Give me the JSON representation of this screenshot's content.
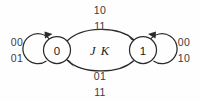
{
  "diagram": {
    "type": "state-transition-diagram",
    "center_label": "J K",
    "states": [
      {
        "id": "s0",
        "label": "0",
        "cx": 57,
        "cy": 50,
        "r": 13.5
      },
      {
        "id": "s1",
        "label": "1",
        "cx": 143,
        "cy": 50,
        "r": 13.5
      }
    ],
    "transitions": [
      {
        "id": "t-self-0",
        "from": "0",
        "to": "0",
        "kind": "self-loop",
        "side": "left",
        "label_lines": [
          "00",
          "01"
        ],
        "label_x": 17,
        "label_y_top": 42,
        "label_y_bottom": 58
      },
      {
        "id": "t-0-to-1",
        "from": "0",
        "to": "1",
        "kind": "arc",
        "side": "top",
        "label_lines": [
          "10",
          "11"
        ],
        "label_x": 100,
        "label_y_top": 10,
        "label_y_bottom": 26
      },
      {
        "id": "t-1-to-0",
        "from": "1",
        "to": "0",
        "kind": "arc",
        "side": "bottom",
        "label_lines": [
          "01",
          "11"
        ],
        "label_x": 100,
        "label_y_top": 76,
        "label_y_bottom": 92
      },
      {
        "id": "t-self-1",
        "from": "1",
        "to": "1",
        "kind": "self-loop",
        "side": "right",
        "label_lines": [
          "00",
          "10"
        ],
        "label_x": 184,
        "label_y_top": 42,
        "label_y_bottom": 58
      }
    ],
    "colors": {
      "stroke": "#2b2b2b",
      "background": "#fefefe",
      "text": "#1a1a1a",
      "label_text": "#3a3a3a"
    }
  }
}
